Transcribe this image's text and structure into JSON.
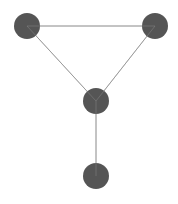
{
  "diagram": {
    "type": "graph",
    "background": "#ffffff",
    "node_color": "#555555",
    "edge_color": "#9a9a9a",
    "node_radius": 13,
    "nodes": [
      {
        "id": "n1",
        "x": 27,
        "y": 26
      },
      {
        "id": "n2",
        "x": 155,
        "y": 26
      },
      {
        "id": "n3",
        "x": 96,
        "y": 101
      },
      {
        "id": "n4",
        "x": 96,
        "y": 176
      }
    ],
    "edges": [
      {
        "source": "n1",
        "target": "n2"
      },
      {
        "source": "n1",
        "target": "n3"
      },
      {
        "source": "n2",
        "target": "n3"
      },
      {
        "source": "n3",
        "target": "n4"
      }
    ]
  }
}
